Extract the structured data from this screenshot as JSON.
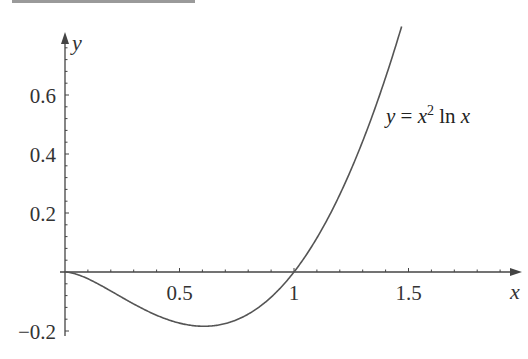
{
  "chart_data": {
    "type": "line",
    "title": "",
    "xlabel": "x",
    "ylabel": "y",
    "function": "y = x^2 ln x",
    "annotation": {
      "prefix": "y = x",
      "superscript": "2",
      "suffix": " ln x"
    },
    "x_ticks": [
      {
        "value": 0.5,
        "label": "0.5"
      },
      {
        "value": 1,
        "label": "1"
      },
      {
        "value": 1.5,
        "label": "1.5"
      }
    ],
    "y_ticks": [
      {
        "value": 0.6,
        "label": "0.6"
      },
      {
        "value": 0.4,
        "label": "0.4"
      },
      {
        "value": 0.2,
        "label": "0.2"
      },
      {
        "value": -0.2,
        "label": "−0.2"
      }
    ],
    "xlim": [
      0,
      1.6
    ],
    "ylim": [
      -0.2,
      0.8
    ],
    "grid": false,
    "legend": "none",
    "series": [
      {
        "name": "y = x^2 ln x",
        "x": [
          0,
          0.1,
          0.2,
          0.3,
          0.4,
          0.5,
          0.607,
          0.7,
          0.8,
          0.9,
          1.0,
          1.1,
          1.2,
          1.3,
          1.4,
          1.47
        ],
        "y": [
          0,
          -0.023,
          -0.064,
          -0.108,
          -0.147,
          -0.173,
          -0.184,
          -0.175,
          -0.143,
          -0.085,
          0,
          0.115,
          0.263,
          0.443,
          0.659,
          0.832
        ]
      }
    ],
    "colors": {
      "curve": "#555555",
      "axis": "#444444",
      "text": "#333333"
    }
  }
}
